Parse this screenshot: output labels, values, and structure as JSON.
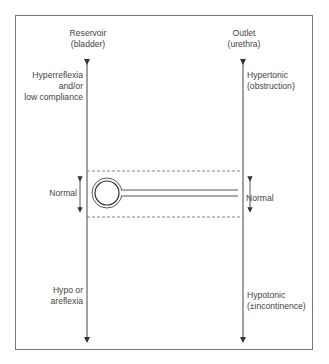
{
  "diagram": {
    "left_axis": {
      "title": "Reservoir",
      "subtitle": "(bladder)",
      "top_label": [
        "Hyperreflexia",
        "and/or",
        "low compliance"
      ],
      "middle_label": "Normal",
      "bottom_label": [
        "Hypo or",
        "areflexia"
      ]
    },
    "right_axis": {
      "title": "Outlet",
      "subtitle": "(urethra)",
      "top_label": [
        "Hypertonic",
        "(obstruction)"
      ],
      "middle_label": "Normal",
      "bottom_label": [
        "Hypotonic",
        "(±incontinence)"
      ]
    },
    "center_icon": "bladder-urethra-schematic",
    "normal_zone": "dashed-band"
  }
}
